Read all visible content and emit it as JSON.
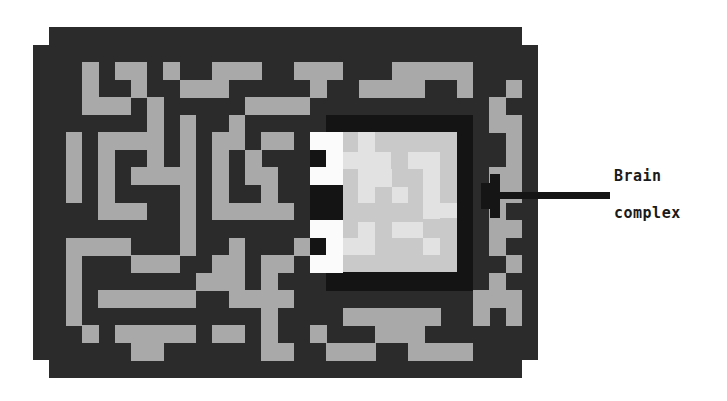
{
  "figure": {
    "type": "pixel-art maze diagram",
    "annotation": {
      "line1": "Brain",
      "line2": "complex"
    },
    "colors": {
      "wall": "#2b2b2b",
      "corridor": "#a9a9a9",
      "brain_frame": "#141414",
      "brain_white": "#fbfbfb",
      "brain_base": "#c9c9c9",
      "brain_bright": "#e2e2e2",
      "arrow": "#151515"
    },
    "grid": {
      "x0": 33,
      "y0": 27,
      "cell_w": 16.3,
      "cell_h": 17.55,
      "cols": 31,
      "rows": 20,
      "outline_rows": [
        {
          "row": 0,
          "from": 1,
          "to": 29
        },
        {
          "row": 19,
          "from": 1,
          "to": 29
        }
      ],
      "corridors": {
        "2": [
          3,
          5,
          6,
          8,
          11,
          12,
          13,
          16,
          17,
          18,
          22,
          23,
          24,
          25,
          26
        ],
        "3": [
          3,
          6,
          9,
          10,
          11,
          17,
          20,
          21,
          22,
          23,
          26,
          29
        ],
        "4": [
          3,
          4,
          5,
          7,
          13,
          14,
          15,
          16,
          28
        ],
        "5": [
          7,
          9,
          12,
          28,
          29
        ],
        "6": [
          2,
          4,
          5,
          6,
          7,
          9,
          11,
          12,
          14,
          15,
          29
        ],
        "7": [
          2,
          4,
          7,
          9,
          11,
          13,
          29
        ],
        "8": [
          2,
          4,
          6,
          7,
          8,
          9,
          11,
          13,
          14,
          28,
          29
        ],
        "9": [
          2,
          4,
          9,
          11,
          14,
          28,
          29
        ],
        "10": [
          4,
          5,
          6,
          9,
          11,
          12,
          13,
          14,
          15,
          28
        ],
        "11": [
          9,
          28,
          29
        ],
        "12": [
          2,
          3,
          4,
          5,
          9,
          12,
          16,
          28
        ],
        "13": [
          2,
          6,
          7,
          8,
          11,
          12,
          14,
          15,
          29
        ],
        "14": [
          2,
          10,
          11,
          12,
          14,
          28
        ],
        "15": [
          2,
          4,
          5,
          6,
          7,
          8,
          9,
          12,
          13,
          14,
          15,
          27,
          28,
          29
        ],
        "16": [
          2,
          14,
          19,
          20,
          21,
          22,
          23,
          24,
          27,
          29
        ],
        "17": [
          3,
          5,
          6,
          7,
          8,
          9,
          11,
          12,
          14,
          17,
          21,
          22,
          23
        ],
        "18": [
          6,
          7,
          14,
          15,
          18,
          19,
          20,
          23,
          24,
          25,
          26
        ]
      }
    },
    "brain": {
      "frame": {
        "x": 326,
        "y": 115,
        "w": 147,
        "h": 176
      },
      "white_cells": [
        {
          "row": 6,
          "cols": [
            17,
            18
          ]
        },
        {
          "row": 7,
          "cols": [
            18
          ]
        },
        {
          "row": 8,
          "cols": [
            17,
            18
          ]
        },
        {
          "row": 11,
          "cols": [
            17,
            18
          ]
        },
        {
          "row": 12,
          "cols": [
            18
          ]
        },
        {
          "row": 13,
          "cols": [
            17,
            18
          ]
        }
      ],
      "base": {
        "x": 343,
        "y": 132,
        "w": 114,
        "h": 140
      },
      "bright_rects": [
        [
          358,
          132,
          17,
          20
        ],
        [
          343,
          152,
          48,
          17
        ],
        [
          358,
          169,
          34,
          18
        ],
        [
          358,
          187,
          17,
          16
        ],
        [
          392,
          187,
          16,
          16
        ],
        [
          408,
          152,
          32,
          17
        ],
        [
          423,
          169,
          17,
          50
        ],
        [
          423,
          203,
          34,
          15
        ],
        [
          392,
          222,
          31,
          16
        ],
        [
          358,
          222,
          17,
          16
        ],
        [
          343,
          238,
          32,
          17
        ],
        [
          423,
          238,
          17,
          17
        ]
      ]
    },
    "arrow": {
      "line": {
        "x": 482,
        "y": 192,
        "w": 128,
        "h": 7
      },
      "head": [
        [
          490,
          174,
          10,
          44
        ],
        [
          481,
          183,
          9,
          26
        ]
      ]
    }
  }
}
